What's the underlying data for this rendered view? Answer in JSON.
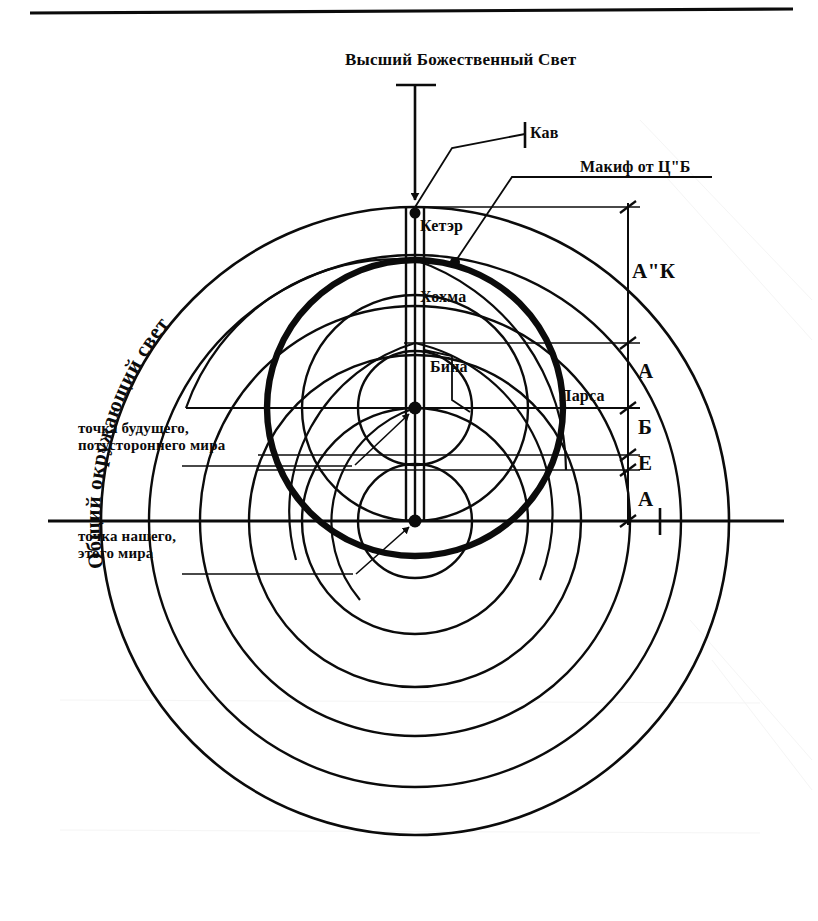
{
  "page": {
    "width": 818,
    "height": 921,
    "background": "#ffffff",
    "ink": "#0b0b0b",
    "top_rule": true
  },
  "diagram": {
    "kind": "kabbalah-concentric-circles",
    "title": "Высший Божественный Свет",
    "curved_label": "Общий окружающий свет",
    "labels": {
      "kav": "Кав",
      "makif": "Макиф от Ц\"Б",
      "keter": "Кетэр",
      "hochma": "Хохма",
      "bina": "Бина",
      "parsa": "Парса"
    },
    "annotations": [
      {
        "id": "future-world-point",
        "line1": "точка будущего,",
        "line2": "потустороннего мира"
      },
      {
        "id": "our-world-point",
        "line1": "точка нашего,",
        "line2": "этого мира"
      }
    ],
    "scale_labels": [
      {
        "id": "ak",
        "text": "А\"К"
      },
      {
        "id": "atzilut",
        "text": "А"
      },
      {
        "id": "bria",
        "text": "Б"
      },
      {
        "id": "yetzira",
        "text": "Е"
      },
      {
        "id": "assiya",
        "text": "А"
      }
    ],
    "geometry": {
      "center_lower": {
        "x": 415,
        "y": 521
      },
      "center_upper": {
        "x": 415,
        "y": 408
      },
      "baseline_y": 521,
      "dimension_axis_x": 628,
      "dimension_ticks_y": [
        207,
        343,
        408,
        455,
        470,
        521
      ],
      "concentric_radii": [
        314,
        266,
        215,
        166,
        113,
        57
      ],
      "makif_circle": {
        "cx": 415,
        "cy": 408,
        "r": 148
      },
      "arrow_top_y": 85,
      "arrow_tip_y": 210
    }
  }
}
